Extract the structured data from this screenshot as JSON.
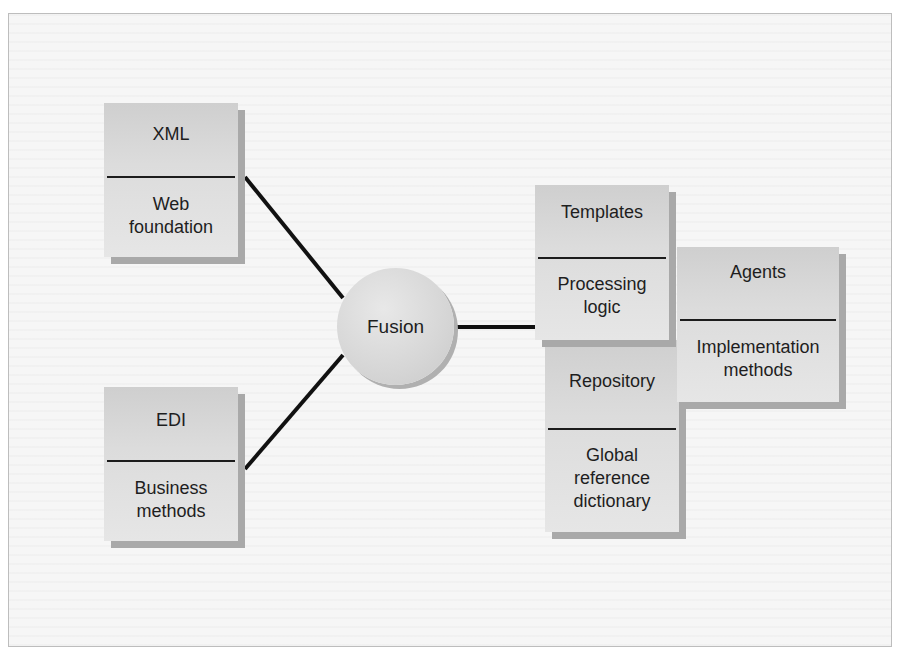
{
  "diagram": {
    "center": {
      "label": "Fusion"
    },
    "left_nodes": [
      {
        "title": "XML",
        "subtitle": "Web foundation"
      },
      {
        "title": "EDI",
        "subtitle": "Business methods"
      }
    ],
    "right_nodes": [
      {
        "title": "Templates",
        "subtitle": "Processing logic"
      },
      {
        "title": "Agents",
        "subtitle": "Implementation methods"
      },
      {
        "title": "Repository",
        "subtitle": "Global reference dictionary"
      }
    ],
    "connections": [
      {
        "from": "XML",
        "to": "Fusion"
      },
      {
        "from": "EDI",
        "to": "Fusion"
      },
      {
        "from": "Fusion",
        "to": "Templates"
      }
    ],
    "colors": {
      "box_fill": "#dcdcdc",
      "box_shadow": "#a9a9a9",
      "line": "#111111",
      "frame_border": "#bdbdbd"
    }
  }
}
